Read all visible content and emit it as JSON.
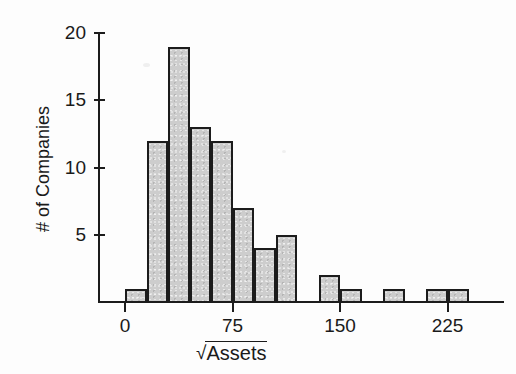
{
  "chart_data": {
    "type": "bar",
    "title": "",
    "subtitle": "",
    "xlabel": "√Assets",
    "xlabel_radical": "√",
    "xlabel_radicand": "Assets",
    "ylabel": "# of Companies",
    "grid": false,
    "legend": false,
    "bin_width": 15,
    "xlim": [
      0,
      255
    ],
    "ylim": [
      0,
      20
    ],
    "x_ticks": [
      0,
      75,
      150,
      225
    ],
    "x_tick_labels": [
      "0",
      "75",
      "150",
      "225"
    ],
    "y_ticks": [
      5,
      10,
      15,
      20
    ],
    "y_tick_labels": [
      "5",
      "10",
      "15",
      "20"
    ],
    "categories": [
      "0–15",
      "15–30",
      "30–45",
      "45–60",
      "60–75",
      "75–90",
      "90–105",
      "105–120",
      "120–135",
      "135–150",
      "150–165",
      "165–180",
      "180–195",
      "195–210",
      "210–225",
      "225–240"
    ],
    "bin_starts": [
      0,
      15,
      30,
      45,
      60,
      75,
      90,
      105,
      120,
      135,
      150,
      165,
      180,
      195,
      210,
      225
    ],
    "values": [
      1,
      12,
      19,
      13,
      12,
      7,
      4,
      5,
      0,
      2,
      1,
      0,
      1,
      0,
      1,
      1
    ],
    "bar_fill_color": "#cdcdcd",
    "bar_edge_color": "#1c1c1c",
    "background_color": "#ffffff"
  },
  "axes": {
    "y_title": "# of Companies"
  }
}
